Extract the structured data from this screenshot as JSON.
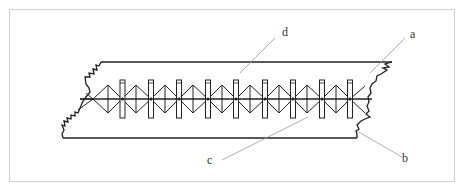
{
  "figure": {
    "labels": {
      "a": "a",
      "b": "b",
      "c": "c",
      "d": "d"
    },
    "frame": {
      "x": 9,
      "y": 9,
      "w": 445,
      "h": 172,
      "color": "#cfcfcf"
    },
    "slab": {
      "top_y": 62,
      "bottom_y": 138,
      "center_y": 99,
      "top_x1": 101,
      "top_x2": 392,
      "bottom_x1": 63,
      "bottom_x2": 357
    },
    "verticals_x": [
      122,
      151,
      179,
      208,
      236,
      265,
      293,
      322,
      350
    ],
    "colors": {
      "line": "#222222",
      "leader": "#9a9a9a"
    }
  }
}
